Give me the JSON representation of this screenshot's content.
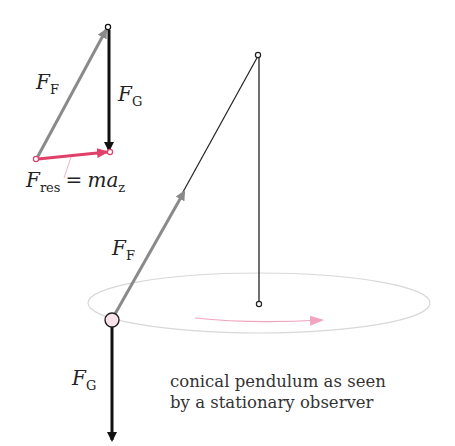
{
  "diagram": {
    "caption": {
      "line1": "conical pendulum as seen",
      "line2": "by a stationary observer"
    },
    "labels": {
      "ff_main": {
        "symbol": "F",
        "subscript": "F"
      },
      "fg_main": {
        "symbol": "F",
        "subscript": "G"
      },
      "ff_triangle": {
        "symbol": "F",
        "subscript": "F"
      },
      "fg_triangle": {
        "symbol": "F",
        "subscript": "G"
      },
      "fres": {
        "symbol": "F",
        "subscript": "res",
        "equals": "=",
        "rhs": "ma",
        "rhs_subscript": "z"
      }
    },
    "colors": {
      "thread_force": "#8a8a8a",
      "gravity": "#111111",
      "resultant": "#e0406a",
      "orbit": "#d8d8d8",
      "motion_arrow": "#f2a3bd",
      "bob_fill": "#f7e3e8"
    }
  }
}
